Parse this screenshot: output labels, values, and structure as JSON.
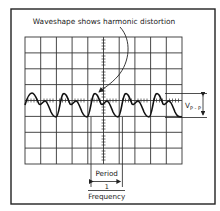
{
  "diagram": {
    "callout": "Waveshape shows harmonic distortion",
    "vpp_label": {
      "main": "V",
      "sub": "P - P"
    },
    "period_label": "Period",
    "fraction_numerator": "1",
    "fraction_denominator": "Frequency",
    "grid": {
      "columns": 10,
      "rows": 8
    },
    "colors": {
      "line": "#222222",
      "grid": "#333333",
      "background": "#ffffff"
    }
  }
}
